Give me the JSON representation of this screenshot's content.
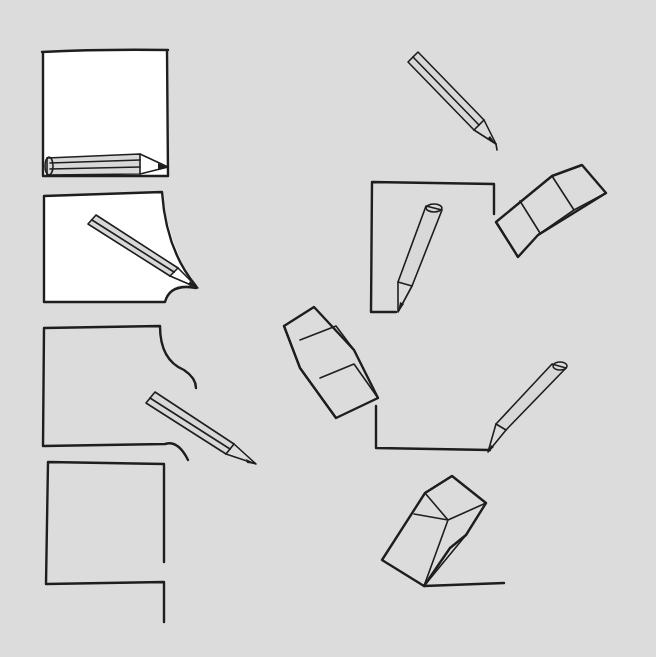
{
  "illustration": {
    "description": "Hand-drawn sketch of pencils drawing paper outlines and erasers",
    "background_color": "#dcdcdc",
    "ink_color": "#1e1e1e",
    "paper_color": "#ffffff",
    "left_sequence": [
      {
        "frame": 1,
        "label": "pencil under full white sheet"
      },
      {
        "frame": 2,
        "label": "pencil drawing sheet corner"
      },
      {
        "frame": 3,
        "label": "pencil drawing outline curve"
      },
      {
        "frame": 4,
        "label": "open outline"
      }
    ],
    "right_sequence": [
      {
        "item": "pencil-top"
      },
      {
        "item": "outline-with-pencil"
      },
      {
        "item": "eraser-upper"
      },
      {
        "item": "eraser-middle"
      },
      {
        "item": "pencil-lower-right"
      },
      {
        "item": "eraser-bottom"
      }
    ]
  }
}
